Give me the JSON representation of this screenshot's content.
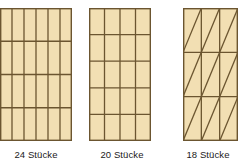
{
  "figure": {
    "title": "",
    "background_color": "#ffffff",
    "panels": [
      {
        "id": "panel-24",
        "caption": "24 Stücke",
        "count": 24,
        "division_type": "grid",
        "columns": 6,
        "rows": 4,
        "pieces_per_cell": 1,
        "shape": "rectangle",
        "fill_color": "#f2dfb3",
        "line_color": "#6b5530",
        "border_color": "#6b5530",
        "width_px": 72,
        "height_px": 133,
        "clipped_left": true
      },
      {
        "id": "panel-20",
        "caption": "20 Stücke",
        "count": 20,
        "division_type": "grid",
        "columns": 4,
        "rows": 5,
        "pieces_per_cell": 1,
        "shape": "rectangle",
        "fill_color": "#f2dfb3",
        "line_color": "#6b5530",
        "border_color": "#6b5530",
        "width_px": 62,
        "height_px": 133,
        "clipped_left": false
      },
      {
        "id": "panel-18",
        "caption": "18 Stücke",
        "count": 18,
        "division_type": "grid-with-diagonals",
        "columns": 3,
        "rows": 3,
        "pieces_per_cell": 2,
        "diagonal_direction": "bottom-left-to-top-right",
        "shape": "rectangle",
        "fill_color": "#f2dfb3",
        "line_color": "#6b5530",
        "border_color": "#6b5530",
        "width_px": 55,
        "height_px": 133,
        "clipped_left": false
      }
    ]
  }
}
